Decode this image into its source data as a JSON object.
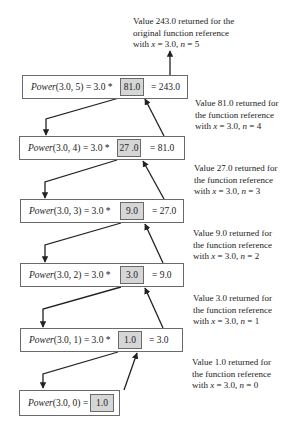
{
  "diagram": {
    "frames": [
      {
        "func": "Power",
        "args": "(3.0, 5)",
        "op": " = 3.0 * ",
        "value": "81.0",
        "result": "= 243.0"
      },
      {
        "func": "Power",
        "args": "(3.0, 4)",
        "op": " = 3.0 * ",
        "value": "27 .0",
        "result": "= 81.0"
      },
      {
        "func": "Power",
        "args": "(3.0, 3)",
        "op": " = 3.0 * ",
        "value": "9.0",
        "result": "= 27.0"
      },
      {
        "func": "Power",
        "args": "(3.0, 2)",
        "op": " = 3.0 * ",
        "value": "3.0",
        "result": "= 9.0"
      },
      {
        "func": "Power",
        "args": "(3.0, 1)",
        "op": " = 3.0 * ",
        "value": "1.0",
        "result": "= 3.0"
      },
      {
        "func": "Power",
        "args": "(3.0, 0)",
        "op": " = ",
        "value": "1.0",
        "result": ""
      }
    ],
    "notes": [
      {
        "line1": "Value 243.0 returned for the",
        "line2": "original function reference",
        "line3_pre": "with ",
        "x_var": "x",
        "x_eq": " = 3.0, ",
        "n_var": "n",
        "n_eq": " = 5"
      },
      {
        "line1": "Value 81.0 returned for",
        "line2": "the function reference",
        "line3_pre": "with ",
        "x_var": "x",
        "x_eq": " = 3.0, ",
        "n_var": "n",
        "n_eq": " = 4"
      },
      {
        "line1": "Value 27.0 returned for",
        "line2": "the function reference",
        "line3_pre": "with ",
        "x_var": "x",
        "x_eq": " = 3.0, ",
        "n_var": "n",
        "n_eq": " = 3"
      },
      {
        "line1": "Value 9.0 returned for",
        "line2": "the function reference",
        "line3_pre": "with ",
        "x_var": "x",
        "x_eq": " = 3.0, ",
        "n_var": "n",
        "n_eq": " = 2"
      },
      {
        "line1": "Value 3.0 returned for",
        "line2": "the function reference",
        "line3_pre": "with ",
        "x_var": "x",
        "x_eq": " = 3.0, ",
        "n_var": "n",
        "n_eq": " = 1"
      },
      {
        "line1": "Value 1.0 returned for",
        "line2": "the function reference",
        "line3_pre": "with ",
        "x_var": "x",
        "x_eq": " = 3.0, ",
        "n_var": "n",
        "n_eq": " = 0"
      }
    ],
    "colors": {
      "stroke": "#333333",
      "frame_border": "#6a6a6a",
      "value_fill": "#d6d6d6"
    }
  }
}
